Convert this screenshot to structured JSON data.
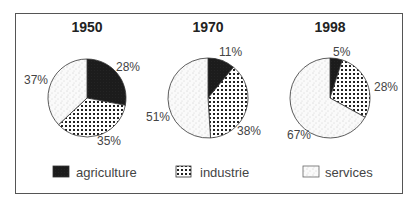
{
  "chart_data": [
    {
      "type": "pie",
      "title": "1950",
      "categories": [
        "agriculture",
        "industrie",
        "services"
      ],
      "values": [
        28,
        35,
        37
      ],
      "labels": [
        "28%",
        "35%",
        "37%"
      ]
    },
    {
      "type": "pie",
      "title": "1970",
      "categories": [
        "agriculture",
        "industrie",
        "services"
      ],
      "values": [
        11,
        38,
        51
      ],
      "labels": [
        "11%",
        "38%",
        "51%"
      ]
    },
    {
      "type": "pie",
      "title": "1998",
      "categories": [
        "agriculture",
        "industrie",
        "services"
      ],
      "values": [
        5,
        28,
        67
      ],
      "labels": [
        "5%",
        "28%",
        "67%"
      ]
    }
  ],
  "charts": [
    {
      "title": "1950",
      "agriculture": "28%",
      "industrie": "35%",
      "services": "37%"
    },
    {
      "title": "1970",
      "agriculture": "11%",
      "industrie": "38%",
      "services": "51%"
    },
    {
      "title": "1998",
      "agriculture": "5%",
      "industrie": "28%",
      "services": "67%"
    }
  ],
  "legend": {
    "position": "bottom",
    "items": [
      {
        "label": "agriculture",
        "pattern": "solid-dark",
        "color": "#1a1a1a"
      },
      {
        "label": "industrie",
        "pattern": "dots-grid",
        "color": "#222222"
      },
      {
        "label": "services",
        "pattern": "light-stipple",
        "color": "#f4f4f4"
      }
    ]
  }
}
